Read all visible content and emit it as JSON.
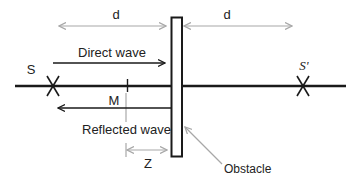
{
  "diagram": {
    "type": "wave-reflection",
    "colors": {
      "line": "#1a1a1a",
      "dimension": "#a8a8a8",
      "text": "#222222",
      "background": "#ffffff"
    },
    "labels": {
      "d_left": "d",
      "d_right": "d",
      "source": "S",
      "image_source": "S'",
      "direct_wave": "Direct wave",
      "reflected_wave": "Reflected wave",
      "midpoint": "M",
      "distance_z": "Z",
      "obstacle": "Obstacle"
    }
  }
}
